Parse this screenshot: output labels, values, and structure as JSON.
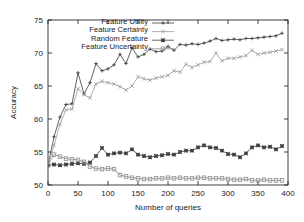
{
  "chart_data": {
    "type": "line",
    "title": "",
    "xlabel": "Number of queries",
    "ylabel": "Accuracy",
    "xlim": [
      0,
      400
    ],
    "ylim": [
      50,
      75
    ],
    "xticks": [
      0,
      50,
      100,
      150,
      200,
      250,
      300,
      350,
      400
    ],
    "yticks": [
      50,
      55,
      60,
      65,
      70,
      75
    ],
    "grid": false,
    "legend_position": "top-center",
    "x": [
      0,
      10,
      20,
      30,
      40,
      50,
      60,
      70,
      80,
      90,
      100,
      110,
      120,
      130,
      140,
      150,
      160,
      170,
      180,
      190,
      200,
      210,
      220,
      230,
      240,
      250,
      260,
      270,
      280,
      290,
      300,
      310,
      320,
      330,
      340,
      350,
      360,
      370,
      380,
      390
    ],
    "series": [
      {
        "name": "Feature Utility",
        "marker": "plus",
        "color": "#3c3c3c",
        "values": [
          53.0,
          57.3,
          60.3,
          62.2,
          62.3,
          67.0,
          63.8,
          65.5,
          68.4,
          67.3,
          67.6,
          68.2,
          69.8,
          68.4,
          70.8,
          69.4,
          69.8,
          70.6,
          70.2,
          70.3,
          71.0,
          70.4,
          71.3,
          71.2,
          71.4,
          71.3,
          71.5,
          71.8,
          72.2,
          71.9,
          72.0,
          72.1,
          72.0,
          72.2,
          72.2,
          72.3,
          72.4,
          72.5,
          72.6,
          73.0
        ]
      },
      {
        "name": "Feature Certainty",
        "marker": "cross",
        "color": "#9a9a9a",
        "values": [
          53.0,
          56.0,
          59.2,
          61.4,
          61.5,
          64.6,
          63.7,
          63.2,
          65.3,
          65.7,
          65.5,
          65.3,
          64.9,
          64.4,
          65.0,
          66.4,
          66.1,
          65.9,
          66.2,
          66.4,
          66.6,
          67.3,
          67.1,
          68.3,
          67.8,
          68.2,
          68.6,
          68.7,
          70.0,
          68.8,
          69.2,
          69.2,
          69.4,
          69.6,
          70.4,
          69.8,
          70.0,
          70.1,
          70.3,
          70.5
        ]
      },
      {
        "name": "Random Feature",
        "marker": "star",
        "color": "#3c3c3c",
        "values": [
          53.0,
          53.1,
          53.0,
          53.1,
          53.2,
          53.3,
          53.2,
          53.4,
          54.4,
          55.6,
          54.6,
          54.8,
          54.9,
          54.8,
          55.4,
          54.6,
          54.4,
          54.2,
          54.4,
          54.5,
          54.7,
          54.6,
          55.0,
          55.2,
          55.2,
          55.7,
          56.0,
          55.7,
          55.6,
          55.2,
          54.7,
          54.6,
          54.2,
          54.8,
          55.7,
          56.0,
          55.7,
          55.8,
          55.4,
          55.9
        ]
      },
      {
        "name": "Feature Uncertainty",
        "marker": "square",
        "color": "#8c8c8c",
        "values": [
          53.0,
          54.6,
          54.3,
          54.0,
          53.9,
          53.8,
          53.5,
          52.8,
          52.5,
          52.4,
          52.5,
          52.4,
          51.5,
          51.3,
          51.1,
          51.0,
          50.9,
          50.9,
          51.0,
          51.0,
          51.1,
          51.0,
          51.1,
          51.0,
          51.0,
          51.1,
          51.1,
          51.0,
          51.0,
          51.0,
          50.9,
          50.8,
          50.8,
          50.9,
          50.7,
          50.7,
          50.8,
          50.7,
          50.7,
          50.7
        ]
      }
    ]
  },
  "legend": {
    "items": [
      {
        "label": "Feature Utility"
      },
      {
        "label": "Feature Certainty"
      },
      {
        "label": "Random Feature"
      },
      {
        "label": "Feature Uncertainty"
      }
    ]
  }
}
